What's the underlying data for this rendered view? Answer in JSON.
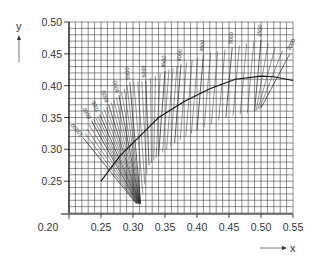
{
  "chart_data": {
    "type": "line",
    "title": "",
    "xlabel": "x",
    "ylabel": "y",
    "xlim": [
      0.2,
      0.55
    ],
    "ylim": [
      0.2,
      0.5
    ],
    "x_ticks": [
      "0.20",
      "0.25",
      "0.30",
      "0.35",
      "0.40",
      "0.45",
      "0.50",
      "0.55"
    ],
    "y_ticks": [
      "0.25",
      "0.30",
      "0.35",
      "0.40",
      "0.45",
      "0.50"
    ],
    "grid": true,
    "grid_minor_step": 0.01,
    "legend": null,
    "series": [
      {
        "name": "planckian-locus",
        "points": [
          [
            0.25,
            0.25
          ],
          [
            0.28,
            0.29
          ],
          [
            0.31,
            0.32
          ],
          [
            0.34,
            0.35
          ],
          [
            0.38,
            0.375
          ],
          [
            0.42,
            0.395
          ],
          [
            0.46,
            0.41
          ],
          [
            0.5,
            0.415
          ],
          [
            0.52,
            0.414
          ],
          [
            0.55,
            0.408
          ]
        ]
      }
    ],
    "isotemperature_lines": [
      {
        "label": "10000",
        "x1": 0.222,
        "y1": 0.318,
        "x2": 0.305,
        "y2": 0.215
      },
      {
        "label": "8000",
        "x1": 0.235,
        "y1": 0.345,
        "x2": 0.307,
        "y2": 0.215
      },
      {
        "label": "7000",
        "x1": 0.248,
        "y1": 0.355,
        "x2": 0.309,
        "y2": 0.215
      },
      {
        "label": "6500",
        "x1": 0.262,
        "y1": 0.37,
        "x2": 0.31,
        "y2": 0.215
      },
      {
        "label": "6000",
        "x1": 0.278,
        "y1": 0.385,
        "x2": 0.311,
        "y2": 0.215
      },
      {
        "label": "5500",
        "x1": 0.295,
        "y1": 0.405,
        "x2": 0.312,
        "y2": 0.215
      },
      {
        "label": "5000",
        "x1": 0.32,
        "y1": 0.408,
        "x2": 0.325,
        "y2": 0.275
      },
      {
        "label": "4500",
        "x1": 0.35,
        "y1": 0.423,
        "x2": 0.34,
        "y2": 0.29
      },
      {
        "label": "4000",
        "x1": 0.375,
        "y1": 0.433,
        "x2": 0.365,
        "y2": 0.31
      },
      {
        "label": "3500",
        "x1": 0.41,
        "y1": 0.448,
        "x2": 0.4,
        "y2": 0.33
      },
      {
        "label": "3000",
        "x1": 0.455,
        "y1": 0.46,
        "x2": 0.445,
        "y2": 0.35
      },
      {
        "label": "2500",
        "x1": 0.5,
        "y1": 0.472,
        "x2": 0.49,
        "y2": 0.36
      },
      {
        "label": "2000",
        "x1": 0.545,
        "y1": 0.45,
        "x2": 0.5,
        "y2": 0.365
      }
    ],
    "annotations": [
      "10000",
      "8000",
      "7000",
      "6500",
      "6000",
      "5500",
      "5000",
      "4500",
      "4000",
      "3500",
      "3000",
      "2500",
      "2000"
    ]
  },
  "axes": {
    "x_label": "x",
    "y_label": "y"
  }
}
